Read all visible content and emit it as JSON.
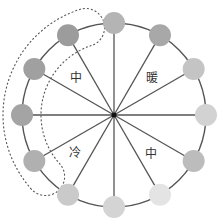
{
  "diagram": {
    "type": "color-wheel",
    "center": {
      "x": 114,
      "y": 115
    },
    "radius": 92,
    "node_radius": 11,
    "spoke_color": "#555555",
    "rim_color": "#555555",
    "nodes": [
      {
        "angle": 0,
        "fill": "#b4b4b4"
      },
      {
        "angle": 30,
        "fill": "#a8a8a8"
      },
      {
        "angle": 60,
        "fill": "#c4c4c4"
      },
      {
        "angle": 90,
        "fill": "#d2d2d2"
      },
      {
        "angle": 120,
        "fill": "#bcbcbc"
      },
      {
        "angle": 150,
        "fill": "#e4e4e4"
      },
      {
        "angle": 180,
        "fill": "#d4d4d4"
      },
      {
        "angle": 210,
        "fill": "#cacaca"
      },
      {
        "angle": 240,
        "fill": "#b0b0b0"
      },
      {
        "angle": 270,
        "fill": "#a4a4a4"
      },
      {
        "angle": 300,
        "fill": "#a0a0a0"
      },
      {
        "angle": 330,
        "fill": "#9c9c9c"
      }
    ],
    "labels": [
      {
        "text": "中",
        "x": 76,
        "y": 78,
        "name": "label-neutral-upper-left"
      },
      {
        "text": "暖",
        "x": 152,
        "y": 78,
        "name": "label-warm"
      },
      {
        "text": "冷",
        "x": 75,
        "y": 153,
        "name": "label-cool"
      },
      {
        "text": "中",
        "x": 151,
        "y": 154,
        "name": "label-neutral-lower-right"
      }
    ],
    "highlight_group": {
      "style": "dashed",
      "color": "#555555",
      "covers_angles": [
        240,
        270,
        300,
        330
      ]
    }
  }
}
